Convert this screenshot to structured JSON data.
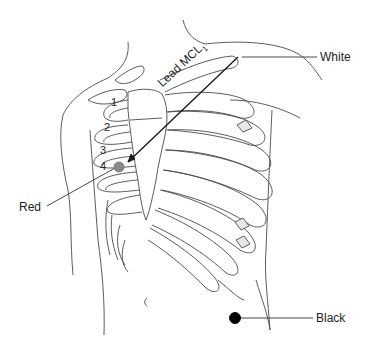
{
  "diagram": {
    "lead_label": "Lead MCL",
    "lead_subscript": "1",
    "electrodes": [
      {
        "label": "White",
        "color": "#ffffff"
      },
      {
        "label": "Red",
        "color": "#8a8a8a"
      },
      {
        "label": "Black",
        "color": "#000000"
      }
    ],
    "intercostal_spaces": [
      "1",
      "2",
      "3",
      "4"
    ]
  }
}
